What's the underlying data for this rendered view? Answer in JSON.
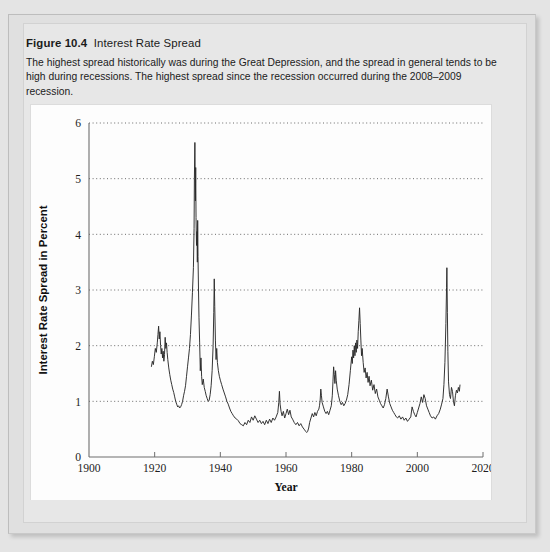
{
  "figure": {
    "number": "Figure 10.4",
    "name": "Interest Rate Spread",
    "caption": "The highest spread historically was during the Great Depression, and the spread in general tends to be high during recessions. The highest spread since the recession occurred during the 2008–2009 recession."
  },
  "chart_data": {
    "type": "line",
    "title": "Interest Rate Spread",
    "xlabel": "Year",
    "ylabel": "Interest Rate Spread in Percent",
    "xlim": [
      1900,
      2020
    ],
    "ylim": [
      0,
      6
    ],
    "xticks": [
      1900,
      1920,
      1940,
      1960,
      1980,
      2000,
      2020
    ],
    "xtick_labels": [
      "1900",
      "1920",
      "1940",
      "1960",
      "1980",
      "2000",
      "2020"
    ],
    "yticks": [
      0,
      1,
      2,
      3,
      4,
      5,
      6
    ],
    "ytick_labels": [
      "0",
      "1",
      "2",
      "3",
      "4",
      "5",
      "6"
    ],
    "grid": "horizontal-dotted",
    "legend": "none",
    "line_color": "#2a2a2a",
    "series": [
      {
        "name": "Interest Rate Spread",
        "x": [
          1919.0,
          1919.3,
          1919.6,
          1919.9,
          1920.2,
          1920.5,
          1920.8,
          1921.0,
          1921.2,
          1921.4,
          1921.6,
          1921.8,
          1922.0,
          1922.2,
          1922.4,
          1922.6,
          1922.8,
          1923.0,
          1923.2,
          1923.4,
          1923.6,
          1923.8,
          1924.0,
          1924.3,
          1924.6,
          1924.9,
          1925.2,
          1925.5,
          1925.8,
          1926.1,
          1926.4,
          1926.7,
          1927.0,
          1927.3,
          1927.6,
          1927.9,
          1928.2,
          1928.5,
          1928.8,
          1929.1,
          1929.4,
          1929.7,
          1930.0,
          1930.3,
          1930.6,
          1930.9,
          1931.2,
          1931.5,
          1931.8,
          1932.0,
          1932.1,
          1932.25,
          1932.4,
          1932.5,
          1932.6,
          1932.75,
          1932.9,
          1933.0,
          1933.1,
          1933.2,
          1933.35,
          1933.5,
          1933.7,
          1933.9,
          1934.1,
          1934.3,
          1934.5,
          1934.8,
          1935.1,
          1935.4,
          1935.7,
          1936.0,
          1936.3,
          1936.6,
          1936.9,
          1937.2,
          1937.5,
          1937.8,
          1938.0,
          1938.15,
          1938.3,
          1938.5,
          1938.7,
          1938.9,
          1939.1,
          1939.4,
          1939.7,
          1940.0,
          1940.4,
          1940.8,
          1941.2,
          1941.6,
          1942.0,
          1942.4,
          1942.8,
          1943.2,
          1943.6,
          1944.0,
          1944.5,
          1945.0,
          1945.5,
          1946.0,
          1946.5,
          1947.0,
          1947.5,
          1948.0,
          1948.5,
          1949.0,
          1949.5,
          1950.0,
          1950.5,
          1951.0,
          1951.5,
          1952.0,
          1952.5,
          1953.0,
          1953.5,
          1954.0,
          1954.5,
          1955.0,
          1955.5,
          1956.0,
          1956.5,
          1957.0,
          1957.5,
          1957.8,
          1958.0,
          1958.2,
          1958.5,
          1958.8,
          1959.2,
          1959.6,
          1960.0,
          1960.4,
          1960.8,
          1961.2,
          1961.6,
          1962.0,
          1962.5,
          1963.0,
          1963.5,
          1964.0,
          1964.5,
          1965.0,
          1965.5,
          1966.0,
          1966.3,
          1966.6,
          1966.9,
          1967.2,
          1967.6,
          1968.0,
          1968.4,
          1968.8,
          1969.2,
          1969.6,
          1970.0,
          1970.2,
          1970.4,
          1970.6,
          1970.8,
          1971.0,
          1971.4,
          1971.8,
          1972.2,
          1972.6,
          1973.0,
          1973.4,
          1973.8,
          1974.1,
          1974.3,
          1974.5,
          1974.7,
          1974.9,
          1975.1,
          1975.3,
          1975.6,
          1976.0,
          1976.4,
          1976.8,
          1977.2,
          1977.6,
          1978.0,
          1978.4,
          1978.8,
          1979.2,
          1979.6,
          1980.0,
          1980.2,
          1980.4,
          1980.6,
          1980.8,
          1981.0,
          1981.2,
          1981.4,
          1981.6,
          1981.8,
          1982.0,
          1982.2,
          1982.4,
          1982.6,
          1982.8,
          1983.0,
          1983.2,
          1983.5,
          1983.8,
          1984.1,
          1984.4,
          1984.7,
          1985.0,
          1985.3,
          1985.6,
          1986.0,
          1986.4,
          1986.8,
          1987.2,
          1987.6,
          1988.0,
          1988.4,
          1988.8,
          1989.2,
          1989.6,
          1990.0,
          1990.4,
          1990.8,
          1991.2,
          1991.6,
          1992.0,
          1992.4,
          1992.8,
          1993.2,
          1993.6,
          1994.0,
          1994.5,
          1995.0,
          1995.5,
          1996.0,
          1996.5,
          1997.0,
          1997.5,
          1998.0,
          1998.4,
          1998.8,
          1999.2,
          1999.6,
          2000.0,
          2000.4,
          2000.8,
          2001.2,
          2001.6,
          2002.0,
          2002.4,
          2002.8,
          2003.2,
          2003.6,
          2004.0,
          2004.5,
          2005.0,
          2005.5,
          2006.0,
          2006.5,
          2007.0,
          2007.4,
          2007.8,
          2008.1,
          2008.4,
          2008.7,
          2008.9,
          2009.0,
          2009.15,
          2009.3,
          2009.5,
          2009.8,
          2010.1,
          2010.4,
          2010.7,
          2011.0,
          2011.3,
          2011.6,
          2011.9,
          2012.2,
          2012.5,
          2012.8,
          2013.0
        ],
        "y": [
          1.62,
          1.72,
          1.66,
          1.8,
          1.95,
          1.88,
          2.05,
          2.2,
          2.35,
          2.12,
          2.25,
          2.0,
          1.85,
          1.95,
          1.78,
          1.9,
          1.72,
          1.84,
          2.15,
          1.95,
          2.05,
          1.88,
          1.75,
          1.6,
          1.48,
          1.38,
          1.3,
          1.22,
          1.16,
          1.08,
          1.0,
          0.95,
          0.9,
          0.92,
          0.88,
          0.9,
          0.94,
          1.0,
          1.1,
          1.18,
          1.28,
          1.45,
          1.62,
          1.78,
          1.95,
          2.2,
          2.55,
          2.95,
          3.4,
          4.1,
          5.0,
          5.65,
          4.6,
          5.2,
          4.3,
          3.8,
          4.05,
          3.5,
          4.25,
          3.6,
          3.0,
          2.5,
          2.05,
          1.55,
          1.78,
          1.45,
          1.3,
          1.4,
          1.25,
          1.18,
          1.1,
          1.05,
          1.0,
          1.02,
          1.12,
          1.28,
          1.55,
          2.0,
          2.6,
          3.2,
          2.7,
          2.1,
          1.75,
          1.95,
          1.7,
          1.55,
          1.45,
          1.38,
          1.3,
          1.22,
          1.15,
          1.08,
          1.0,
          0.95,
          0.88,
          0.82,
          0.78,
          0.74,
          0.7,
          0.68,
          0.65,
          0.6,
          0.58,
          0.56,
          0.62,
          0.58,
          0.66,
          0.62,
          0.72,
          0.66,
          0.74,
          0.68,
          0.62,
          0.66,
          0.6,
          0.64,
          0.58,
          0.66,
          0.6,
          0.68,
          0.62,
          0.7,
          0.66,
          0.72,
          0.8,
          0.98,
          1.18,
          0.95,
          0.82,
          0.74,
          0.82,
          0.7,
          0.78,
          0.86,
          0.76,
          0.84,
          0.72,
          0.68,
          0.62,
          0.58,
          0.62,
          0.56,
          0.6,
          0.54,
          0.5,
          0.46,
          0.44,
          0.46,
          0.52,
          0.62,
          0.7,
          0.78,
          0.72,
          0.8,
          0.74,
          0.82,
          0.86,
          0.92,
          1.02,
          1.22,
          1.1,
          0.98,
          0.9,
          0.82,
          0.78,
          0.82,
          0.76,
          0.84,
          0.92,
          1.1,
          1.35,
          1.62,
          1.48,
          1.32,
          1.55,
          1.38,
          1.22,
          1.1,
          1.0,
          0.94,
          0.98,
          0.92,
          0.96,
          1.02,
          1.12,
          1.3,
          1.55,
          1.8,
          1.68,
          1.92,
          1.78,
          2.0,
          1.82,
          2.05,
          1.88,
          2.1,
          1.95,
          2.25,
          2.45,
          2.68,
          2.4,
          2.1,
          1.82,
          1.95,
          1.7,
          1.52,
          1.6,
          1.42,
          1.52,
          1.34,
          1.45,
          1.28,
          1.38,
          1.2,
          1.3,
          1.14,
          1.22,
          1.08,
          1.02,
          0.96,
          0.92,
          0.88,
          0.94,
          1.05,
          1.22,
          1.08,
          0.96,
          0.9,
          0.84,
          0.8,
          0.76,
          0.72,
          0.7,
          0.74,
          0.68,
          0.72,
          0.66,
          0.7,
          0.64,
          0.68,
          0.72,
          0.9,
          0.82,
          0.76,
          0.72,
          0.8,
          0.88,
          0.96,
          1.08,
          0.98,
          1.12,
          1.05,
          0.92,
          0.86,
          0.8,
          0.74,
          0.7,
          0.72,
          0.68,
          0.74,
          0.78,
          0.86,
          0.95,
          1.05,
          1.3,
          1.7,
          2.4,
          3.05,
          3.4,
          2.6,
          1.9,
          1.35,
          1.12,
          1.05,
          1.25,
          1.18,
          1.0,
          0.92,
          1.1,
          1.2,
          1.15,
          1.25,
          1.18,
          1.3
        ]
      }
    ]
  }
}
